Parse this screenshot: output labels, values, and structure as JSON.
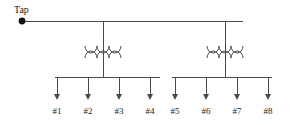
{
  "diagram": {
    "source": {
      "label": "Tap",
      "node_name": "tap-node",
      "node_x": 22,
      "node_y": 21,
      "label_x": 14,
      "label_y": 13
    },
    "feeder": {
      "name": "main-feeder-line",
      "x1": 22,
      "x2": 243,
      "y": 21
    },
    "transformers": [
      {
        "name": "transformer-left",
        "x": 103,
        "primary_y": 46,
        "secondary_y": 58,
        "drop_from_y": 21,
        "drop_to_y": 77,
        "coil_count": 3,
        "coil_width": 12,
        "coil_height": 7,
        "winding_span": 36
      },
      {
        "name": "transformer-right",
        "x": 225,
        "primary_y": 46,
        "secondary_y": 58,
        "drop_from_y": 21,
        "drop_to_y": 77,
        "coil_count": 3,
        "coil_width": 12,
        "coil_height": 7,
        "winding_span": 36
      }
    ],
    "buses": [
      {
        "name": "bus-left",
        "x1": 55,
        "x2": 160,
        "y": 77
      },
      {
        "name": "bus-right",
        "x1": 172,
        "x2": 272,
        "y": 77
      }
    ],
    "loads": [
      {
        "label": "#1",
        "x": 57,
        "bus": "bus-left"
      },
      {
        "label": "#2",
        "x": 88,
        "bus": "bus-left"
      },
      {
        "label": "#3",
        "x": 119,
        "bus": "bus-left"
      },
      {
        "label": "#4",
        "x": 150,
        "bus": "bus-left"
      },
      {
        "label": "#5",
        "x": 175,
        "bus": "bus-right"
      },
      {
        "label": "#6",
        "x": 206,
        "bus": "bus-right"
      },
      {
        "label": "#7",
        "x": 237,
        "bus": "bus-right"
      },
      {
        "label": "#8",
        "x": 268,
        "bus": "bus-right"
      }
    ],
    "load_arrow": {
      "top_y": 77,
      "tip_y": 100,
      "head_width": 6,
      "head_length": 6,
      "label_y": 114
    },
    "colors": {
      "wire": "#4a4a4a",
      "node": "#111111",
      "text": "#1a1a1a",
      "background": "#ffffff"
    }
  }
}
